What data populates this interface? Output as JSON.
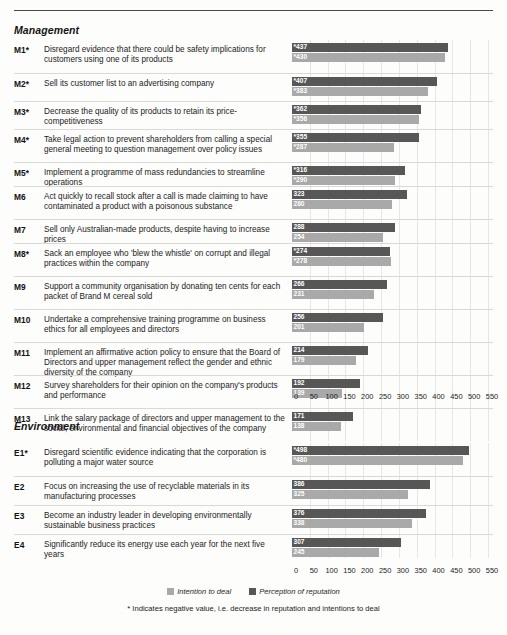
{
  "sections": [
    {
      "id": "management",
      "title": "Management",
      "rows": [
        {
          "code": "M1*",
          "text": "Disregard evidence that there could be safety implications for customers using one of its products",
          "reputation": 437,
          "intention": 430,
          "negative": true
        },
        {
          "code": "M2*",
          "text": "Sell its customer list to an advertising company",
          "reputation": 407,
          "intention": 383,
          "negative": true
        },
        {
          "code": "M3*",
          "text": "Decrease the quality of its products to retain its price-competitiveness",
          "reputation": 362,
          "intention": 356,
          "negative": true
        },
        {
          "code": "M4*",
          "text": "Take legal action to prevent shareholders from calling a special general meeting to question management over policy issues",
          "reputation": 355,
          "intention": 287,
          "negative": true
        },
        {
          "code": "M5*",
          "text": "Implement a programme of mass redundancies to streamline operations",
          "reputation": 316,
          "intention": 290,
          "negative": true
        },
        {
          "code": "M6",
          "text": "Act quickly to recall stock after a call is made claiming to have contaminated a product with a poisonous substance",
          "reputation": 323,
          "intention": 280,
          "negative": false
        },
        {
          "code": "M7",
          "text": "Sell only Australian-made products, despite having to increase prices",
          "reputation": 288,
          "intention": 254,
          "negative": false
        },
        {
          "code": "M8*",
          "text": "Sack an employee who 'blew the whistle' on corrupt and illegal practices within the company",
          "reputation": 274,
          "intention": 278,
          "negative": true
        },
        {
          "code": "M9",
          "text": "Support a community organisation by donating ten cents for each packet of Brand M cereal sold",
          "reputation": 266,
          "intention": 231,
          "negative": false
        },
        {
          "code": "M10",
          "text": "Undertake a comprehensive training programme on business ethics for all employees and directors",
          "reputation": 256,
          "intention": 201,
          "negative": false
        },
        {
          "code": "M11",
          "text": "Implement an affirmative action policy to ensure that the Board of Directors and upper management reflect the gender and ethnic diversity of the company",
          "reputation": 214,
          "intention": 179,
          "negative": false
        },
        {
          "code": "M12",
          "text": "Survey shareholders for their opinion on the company's products and performance",
          "reputation": 192,
          "intention": 139,
          "negative": false
        },
        {
          "code": "M13",
          "text": "Link the salary package of directors and upper management to the social, environmental and financial objectives of the company",
          "reputation": 171,
          "intention": 138,
          "negative": false
        }
      ]
    },
    {
      "id": "environment",
      "title": "Environment",
      "rows": [
        {
          "code": "E1*",
          "text": "Disregard scientific evidence indicating that the corporation is polluting a major water source",
          "reputation": 498,
          "intention": 480,
          "negative": true
        },
        {
          "code": "E2",
          "text": "Focus on increasing the use of recyclable materials in its manufacturing processes",
          "reputation": 386,
          "intention": 325,
          "negative": false
        },
        {
          "code": "E3",
          "text": "Become an industry leader in developing environmentally sustainable business practices",
          "reputation": 376,
          "intention": 338,
          "negative": false
        },
        {
          "code": "E4",
          "text": "Significantly reduce its energy use each year for the next five years",
          "reputation": 307,
          "intention": 245,
          "negative": false
        }
      ]
    }
  ],
  "axis": {
    "ticks": [
      "0",
      "50",
      "100",
      "150",
      "200",
      "250",
      "300",
      "350",
      "400",
      "450",
      "500",
      "550"
    ],
    "min": 0,
    "max": 550
  },
  "legend": {
    "items": [
      {
        "label": "Intention to deal",
        "color": "#a9a9a9",
        "key": "intention"
      },
      {
        "label": "Perception of reputation",
        "color": "#575757",
        "key": "reputation"
      }
    ]
  },
  "footnote": "* Indicates negative value, i.e. decrease in reputation and intentions to deal",
  "colors": {
    "reputation": "#575757",
    "intention": "#a9a9a9",
    "grid": "#e6e6e3",
    "rule": "#d9d9d6"
  },
  "chart_data": {
    "type": "bar",
    "orientation": "horizontal",
    "title": "",
    "xlabel": "",
    "ylabel": "",
    "xlim": [
      0,
      550
    ],
    "xticks": [
      0,
      50,
      100,
      150,
      200,
      250,
      300,
      350,
      400,
      450,
      500,
      550
    ],
    "grid": true,
    "legend_position": "bottom-center",
    "groups": [
      "Management",
      "Environment"
    ],
    "categories": [
      "M1*",
      "M2*",
      "M3*",
      "M4*",
      "M5*",
      "M6",
      "M7",
      "M8*",
      "M9",
      "M10",
      "M11",
      "M12",
      "M13",
      "E1*",
      "E2",
      "E3",
      "E4"
    ],
    "series": [
      {
        "name": "Perception of reputation",
        "color": "#575757",
        "values": [
          437,
          407,
          362,
          355,
          316,
          323,
          288,
          274,
          266,
          256,
          214,
          192,
          171,
          498,
          386,
          376,
          307
        ]
      },
      {
        "name": "Intention to deal",
        "color": "#a9a9a9",
        "values": [
          430,
          383,
          356,
          287,
          290,
          280,
          254,
          278,
          231,
          201,
          179,
          139,
          138,
          480,
          325,
          338,
          245
        ]
      }
    ],
    "annotations": [
      "* Indicates negative value, i.e. decrease in reputation and intentions to deal"
    ]
  }
}
